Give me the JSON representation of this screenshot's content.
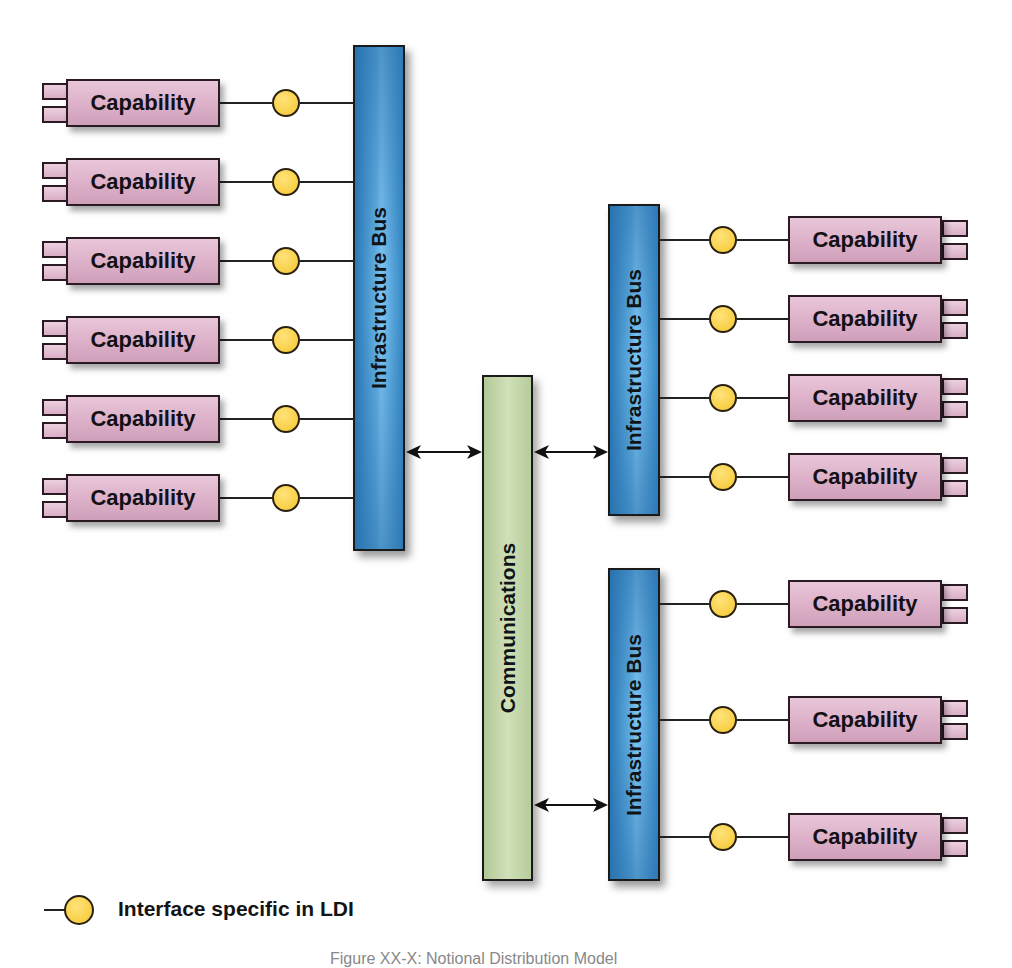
{
  "diagram": {
    "left_bus": {
      "label": "Infrastructure Bus",
      "capabilities": [
        {
          "label": "Capability"
        },
        {
          "label": "Capability"
        },
        {
          "label": "Capability"
        },
        {
          "label": "Capability"
        },
        {
          "label": "Capability"
        },
        {
          "label": "Capability"
        }
      ]
    },
    "communications": {
      "label": "Communications"
    },
    "top_right_bus": {
      "label": "Infrastructure Bus",
      "capabilities": [
        {
          "label": "Capability"
        },
        {
          "label": "Capability"
        },
        {
          "label": "Capability"
        },
        {
          "label": "Capability"
        }
      ]
    },
    "bottom_right_bus": {
      "label": "Infrastructure Bus",
      "capabilities": [
        {
          "label": "Capability"
        },
        {
          "label": "Capability"
        },
        {
          "label": "Capability"
        }
      ]
    },
    "connections": [
      {
        "from": "Infrastructure Bus (left)",
        "to": "Communications",
        "type": "bidirectional-arrow"
      },
      {
        "from": "Communications",
        "to": "Infrastructure Bus (top right)",
        "type": "bidirectional-arrow"
      },
      {
        "from": "Communications",
        "to": "Infrastructure Bus (bottom right)",
        "type": "bidirectional-arrow"
      }
    ]
  },
  "legend": {
    "symbol": "interface-lollipop-icon",
    "label": "Interface specific in LDI"
  },
  "caption": "Figure XX-X: Notional Distribution Model",
  "colors": {
    "capability_fill": "#dcb0c8",
    "interface_fill": "#f8cf45",
    "bus_fill": "#3a8cc8",
    "communications_fill": "#c4d8aa",
    "stroke": "#1a1a1a"
  }
}
